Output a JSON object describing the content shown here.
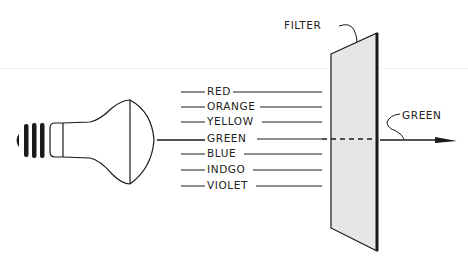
{
  "diagram": {
    "title": "",
    "filter_label": "FILTER",
    "output_label": "GREEN",
    "spectrum": [
      {
        "label": "RED",
        "y": 92
      },
      {
        "label": "ORANGE",
        "y": 107
      },
      {
        "label": "YELLOW",
        "y": 122
      },
      {
        "label": "GREEN",
        "y": 139
      },
      {
        "label": "BLUE",
        "y": 154
      },
      {
        "label": "INDGO",
        "y": 170
      },
      {
        "label": "VIOLET",
        "y": 186
      }
    ],
    "icons": {
      "light_source": "light-bulb-icon",
      "filter": "filter-panel",
      "output": "arrow-right-icon"
    },
    "colors": {
      "ink": "#1a1a1a",
      "filter_fill": "#e6e6e6",
      "background": "#ffffff"
    }
  }
}
